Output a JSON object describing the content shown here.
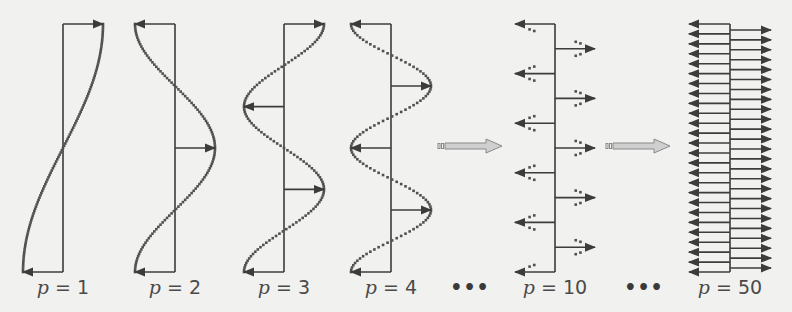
{
  "diagram": {
    "panels": [
      {
        "p": 1,
        "label_var": "p",
        "label_eq": "=",
        "label_num": "1",
        "axis_x": 63,
        "top": 24,
        "bottom": 272,
        "amp": 40
      },
      {
        "p": 2,
        "label_var": "p",
        "label_eq": "=",
        "label_num": "2",
        "axis_x": 175,
        "top": 24,
        "bottom": 272,
        "amp": 40
      },
      {
        "p": 3,
        "label_var": "p",
        "label_eq": "=",
        "label_num": "3",
        "axis_x": 284,
        "top": 24,
        "bottom": 272,
        "amp": 40
      },
      {
        "p": 4,
        "label_var": "p",
        "label_eq": "=",
        "label_num": "4",
        "axis_x": 391,
        "top": 24,
        "bottom": 272,
        "amp": 40
      },
      {
        "p": 10,
        "label_var": "p",
        "label_eq": "=",
        "label_num": "10",
        "axis_x": 555,
        "top": 24,
        "bottom": 272,
        "amp": 40
      },
      {
        "p": 50,
        "label_var": "p",
        "label_eq": "=",
        "label_num": "50",
        "axis_x": 730,
        "top": 24,
        "bottom": 272,
        "amp": 41
      }
    ],
    "ellipses": [
      {
        "text": "•••",
        "x": 470
      },
      {
        "text": "•••",
        "x": 644
      }
    ],
    "transition_arrows": [
      {
        "x": 438,
        "y": 146,
        "length": 64
      },
      {
        "x": 606,
        "y": 146,
        "length": 64
      }
    ],
    "colors": {
      "line": "#3c3c3c",
      "dots": "#505050",
      "transition_arrow_fill": "#cfcfcf",
      "transition_arrow_stroke": "#8a8a8a",
      "background": "#f1f1ef"
    }
  }
}
